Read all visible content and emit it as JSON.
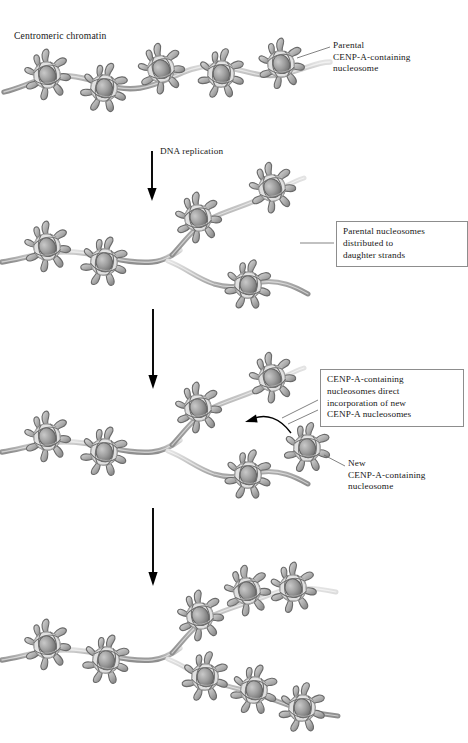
{
  "figure": {
    "title_label": "Centromeric chromatin",
    "background_color": "#ffffff",
    "text_color": "#171717",
    "nucleosome_fill": "#9a9a9a",
    "dna_color": "#b9b9b9",
    "arrow_color": "#000000",
    "box_border_color": "#8d8d8d"
  },
  "labels": {
    "centromeric_chromatin": "Centromeric chromatin",
    "parental_nucleosome": "Parental\nCENP-A-containing\nnucleosome",
    "dna_replication": "DNA replication",
    "parental_distributed": "Parental nucleosomes\ndistributed to\ndaughter strands",
    "cenpa_direct": "CENP-A-containing\nnucleosomes direct\nincorporation of new\nCENP-A nucleosomes",
    "new_nucleosome": "New\nCENP-A-containing\nnucleosome"
  },
  "stages": [
    {
      "name": "stage-1-parental-chromatin",
      "description": "Centromeric chromatin fibre with five parental CENP-A-containing nucleosomes on a single DNA strand",
      "nucleosome_count": 5,
      "strand_count": 1
    },
    {
      "name": "stage-2-after-replication",
      "description": "Replication fork; parental nucleosomes distributed to two daughter strands",
      "nucleosome_count": 5,
      "strand_count": 2
    },
    {
      "name": "stage-3-new-incorporation",
      "description": "Free new CENP-A nucleosome being directed to incorporate into daughter strand",
      "nucleosome_count": 5,
      "free_nucleosome_count": 1,
      "strand_count": 2
    },
    {
      "name": "stage-4-restored-chromatin",
      "description": "Both daughter strands fully populated with CENP-A nucleosomes",
      "nucleosome_count": 9,
      "strand_count": 2
    }
  ],
  "arrows": [
    {
      "name": "arrow-replication",
      "label": "DNA replication"
    },
    {
      "name": "arrow-stage2-to-stage3",
      "label": ""
    },
    {
      "name": "arrow-stage3-to-stage4",
      "label": ""
    },
    {
      "name": "arrow-incorporation",
      "label": ""
    }
  ],
  "icons": {
    "nucleosome": "nucleosome-icon",
    "down_arrow": "down-arrow-icon",
    "curved_arrow": "curved-arrow-icon",
    "leader_line": "leader-line-icon"
  }
}
